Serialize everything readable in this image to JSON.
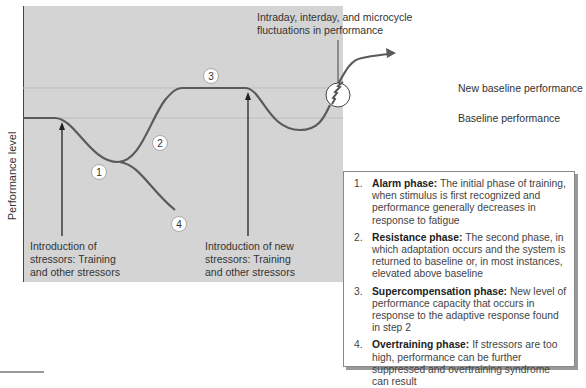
{
  "diagram": {
    "y_axis_label": "Performance level",
    "annotations": {
      "fluctuations": "Intraday, interday, and microcycle fluctuations in performance",
      "stressors_1": [
        "Introduction of",
        "stressors: Training",
        "and other stressors"
      ],
      "stressors_2": [
        "Introduction of new",
        "stressors: Training",
        "and other stressors"
      ]
    },
    "baseline_labels": {
      "new_baseline": "New baseline performance",
      "baseline": "Baseline performance"
    },
    "markers": [
      "1",
      "2",
      "3",
      "4"
    ],
    "colors": {
      "panel_bg": "#d4d4d4",
      "curve": "#5a5a5a",
      "guide_line": "#bdbdbd",
      "arrow": "#222222"
    }
  },
  "legend": {
    "items": [
      {
        "num": "1.",
        "title": "Alarm phase:",
        "text": "The initial phase of training, when stimulus is first recognized and performance generally decreases in response to fatigue"
      },
      {
        "num": "2.",
        "title": "Resistance phase:",
        "text": "The second phase, in which adaptation occurs and the system is returned to baseline or, in most instances, elevated above baseline"
      },
      {
        "num": "3.",
        "title": "Supercompensation phase:",
        "text": "New level of performance capacity that occurs in response to the adaptive response found in step 2"
      },
      {
        "num": "4.",
        "title": "Overtraining phase:",
        "text": "If stressors are too high, performance can be further suppressed and overtraining syndrome can result"
      }
    ]
  }
}
